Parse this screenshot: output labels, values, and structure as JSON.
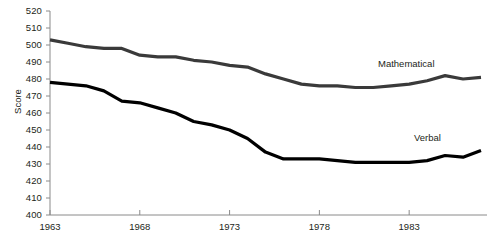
{
  "chart_data": {
    "type": "line",
    "title": "",
    "xlabel": "",
    "ylabel": "Score",
    "ylim": [
      400,
      520
    ],
    "xlim": [
      1963,
      1987
    ],
    "grid": false,
    "legend_position": "inline-right-of-lines",
    "y_ticks": [
      400,
      410,
      420,
      430,
      440,
      450,
      460,
      470,
      480,
      490,
      500,
      510,
      520
    ],
    "x_ticks": [
      1963,
      1968,
      1973,
      1978,
      1983
    ],
    "x": [
      1963,
      1964,
      1965,
      1966,
      1967,
      1968,
      1969,
      1970,
      1971,
      1972,
      1973,
      1974,
      1975,
      1976,
      1977,
      1978,
      1979,
      1980,
      1981,
      1982,
      1983,
      1984,
      1985,
      1986,
      1987
    ],
    "series": [
      {
        "name": "Mathematical",
        "color": "#3a3a3a",
        "values": [
          503,
          501,
          499,
          498,
          498,
          494,
          493,
          493,
          491,
          490,
          488,
          487,
          483,
          480,
          477,
          476,
          476,
          475,
          475,
          476,
          477,
          479,
          482,
          480,
          481
        ]
      },
      {
        "name": "Verbal",
        "color": "#000000",
        "values": [
          478,
          477,
          476,
          473,
          467,
          466,
          463,
          460,
          455,
          453,
          450,
          445,
          437,
          433,
          433,
          433,
          432,
          431,
          431,
          431,
          431,
          432,
          435,
          434,
          438
        ]
      }
    ],
    "annotations": [
      {
        "text": "Mathematical",
        "x": 1983.5,
        "y": 489
      },
      {
        "text": "Verbal",
        "x": 1985.5,
        "y": 444
      }
    ]
  },
  "axes": {
    "y_tick_labels": [
      "520",
      "510",
      "500",
      "490",
      "480",
      "470",
      "460",
      "450",
      "440",
      "430",
      "420",
      "410",
      "400"
    ],
    "x_tick_labels": [
      "1963",
      "1968",
      "1973",
      "1978",
      "1983"
    ],
    "y_axis_title": "Score"
  },
  "labels": {
    "mathematical": "Mathematical",
    "verbal": "Verbal"
  }
}
